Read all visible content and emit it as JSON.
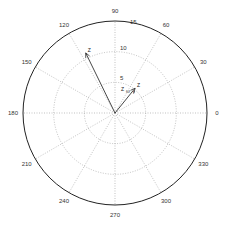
{
  "chart_data": {
    "type": "polar_compass",
    "title": "",
    "center_px": [
      115,
      113
    ],
    "outer_radius_px": 92,
    "rmax": 15,
    "radial_ticks": [
      5,
      10,
      15
    ],
    "angle_ticks": [
      0,
      30,
      60,
      90,
      120,
      150,
      180,
      210,
      240,
      270,
      300,
      330
    ],
    "grid": true,
    "series": [
      {
        "name": "arrow-1",
        "angle_deg": 116,
        "r": 10.9,
        "tip_label": "Z"
      },
      {
        "name": "arrow-2",
        "angle_deg": 51,
        "r": 5.2,
        "tip_label": "Z"
      }
    ],
    "annotations": [
      "Z",
      "Z",
      "r",
      "ω"
    ],
    "colors": {
      "arrow": "#333333",
      "grid": "#999999",
      "frame": "#222222"
    }
  }
}
